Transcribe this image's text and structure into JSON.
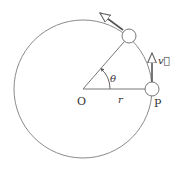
{
  "diagram": {
    "colors": {
      "stroke": "#7a7a7a",
      "text": "#333333",
      "background": "#ffffff"
    },
    "circle": {
      "cx": 83,
      "cy": 89,
      "r": 69
    },
    "labels": {
      "center": "O",
      "radius": "r",
      "point": "P",
      "angle": "θ",
      "velocity": "v⃗"
    },
    "particles": [
      {
        "name": "particle-at-P",
        "cx": 152,
        "cy": 89,
        "r": 7
      },
      {
        "name": "particle-rotated",
        "cx": 129,
        "cy": 36,
        "r": 7
      }
    ],
    "angle_deg": 49
  }
}
